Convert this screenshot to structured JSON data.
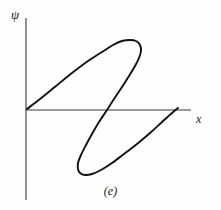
{
  "figure": {
    "caption": "(e)",
    "background_color": "#fefefe",
    "ink_color": "#1a1a1a"
  },
  "axes": {
    "y_label": "ψ",
    "x_label": "x",
    "y_label_name": "psi-axis-label",
    "x_label_name": "x-axis-label",
    "origin": [
      26,
      110
    ],
    "x_axis_start": [
      26,
      110
    ],
    "x_axis_end": [
      191,
      110
    ],
    "y_axis_top": [
      26,
      18
    ],
    "y_axis_bottom": [
      26,
      200
    ],
    "axis_color": "#3a3a3a",
    "axis_width": 1.1
  },
  "chart_data": {
    "type": "line",
    "title": "",
    "xlabel": "x",
    "ylabel": "ψ",
    "grid": false,
    "legend": "none",
    "axis_style": "bare-axes-no-ticks",
    "xlim": [
      0,
      221
    ],
    "ylim": [
      210,
      0
    ],
    "curve_color": "#111111",
    "curve_width": 1.9,
    "series": [
      {
        "name": "hysteresis-loop",
        "closed": false,
        "points_px": [
          [
            27,
            109
          ],
          [
            40,
            99
          ],
          [
            56,
            86
          ],
          [
            72,
            73
          ],
          [
            88,
            61
          ],
          [
            102,
            52
          ],
          [
            113,
            45
          ],
          [
            122,
            41
          ],
          [
            130,
            40
          ],
          [
            136,
            41
          ],
          [
            140,
            45
          ],
          [
            141,
            51
          ],
          [
            139,
            58
          ],
          [
            135,
            66
          ],
          [
            129,
            76
          ],
          [
            122,
            87
          ],
          [
            114,
            99
          ],
          [
            107,
            110
          ],
          [
            99,
            122
          ],
          [
            92,
            134
          ],
          [
            86,
            145
          ],
          [
            81,
            155
          ],
          [
            78,
            163
          ],
          [
            78,
            169
          ],
          [
            80,
            173
          ],
          [
            85,
            175
          ],
          [
            92,
            174
          ],
          [
            101,
            170
          ],
          [
            112,
            163
          ],
          [
            124,
            154
          ],
          [
            137,
            144
          ],
          [
            150,
            133
          ],
          [
            162,
            122
          ],
          [
            172,
            113
          ],
          [
            178,
            108
          ]
        ]
      }
    ]
  }
}
